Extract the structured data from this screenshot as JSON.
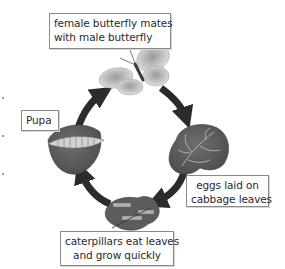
{
  "diagram": {
    "type": "cycle",
    "title": "",
    "stages": [
      {
        "id": "adult",
        "lines": [
          "female butterfly mates",
          "with male butterfly"
        ],
        "icon": "butterfly-icon"
      },
      {
        "id": "eggs",
        "lines": [
          "eggs laid on",
          "cabbage leaves"
        ],
        "icon": "cabbage-leaf-icon"
      },
      {
        "id": "caterpillar",
        "lines": [
          "caterpillars eat leaves",
          "and grow quickly"
        ],
        "icon": "caterpillar-leaves-icon"
      },
      {
        "id": "pupa",
        "lines": [
          "Pupa"
        ],
        "icon": "pupa-on-leaf-icon"
      }
    ],
    "arrows": [
      {
        "from": "adult",
        "to": "eggs",
        "direction": "clockwise"
      },
      {
        "from": "eggs",
        "to": "caterpillar",
        "direction": "clockwise"
      },
      {
        "from": "caterpillar",
        "to": "pupa",
        "direction": "clockwise"
      },
      {
        "from": "pupa",
        "to": "adult",
        "direction": "clockwise"
      }
    ],
    "colors": {
      "arrow": "#2b2b2b",
      "box_border": "#8a8a8a",
      "leaf": "#5a5a5a",
      "butterfly": "#b4b4b4"
    }
  }
}
